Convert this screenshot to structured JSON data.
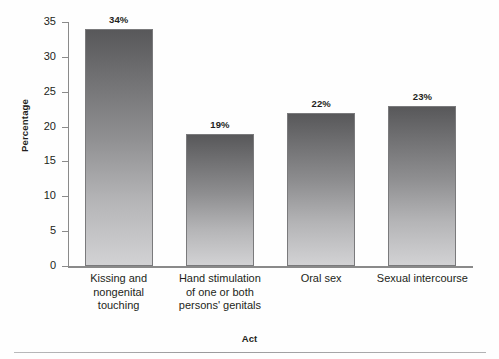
{
  "chart_data": {
    "type": "bar",
    "title": "",
    "xlabel": "Act",
    "ylabel": "Percentage",
    "ylim": [
      0,
      35
    ],
    "ytick_step": 5,
    "yticks": [
      "35",
      "30",
      "25",
      "20",
      "15",
      "10",
      "5",
      "0"
    ],
    "grid": false,
    "legend": "none",
    "categories": [
      "Kissing and\nnongenital\ntouching",
      "Hand stimulation\nof one or both\npersons' genitals",
      "Oral sex",
      "Sexual intercourse"
    ],
    "category_lines": [
      [
        "Kissing and",
        "nongenital",
        "touching"
      ],
      [
        "Hand stimulation",
        "of one or both",
        "persons' genitals"
      ],
      [
        "Oral sex"
      ],
      [
        "Sexual intercourse"
      ]
    ],
    "values": [
      34,
      19,
      22,
      23
    ],
    "data_labels": [
      "34%",
      "19%",
      "22%",
      "23%"
    ],
    "bar_color_top": "#58585a",
    "bar_color_bottom": "#d2d2d4",
    "axis_color": "#8a8a8a",
    "text_color": "#231f20",
    "background": "#fefefe"
  }
}
